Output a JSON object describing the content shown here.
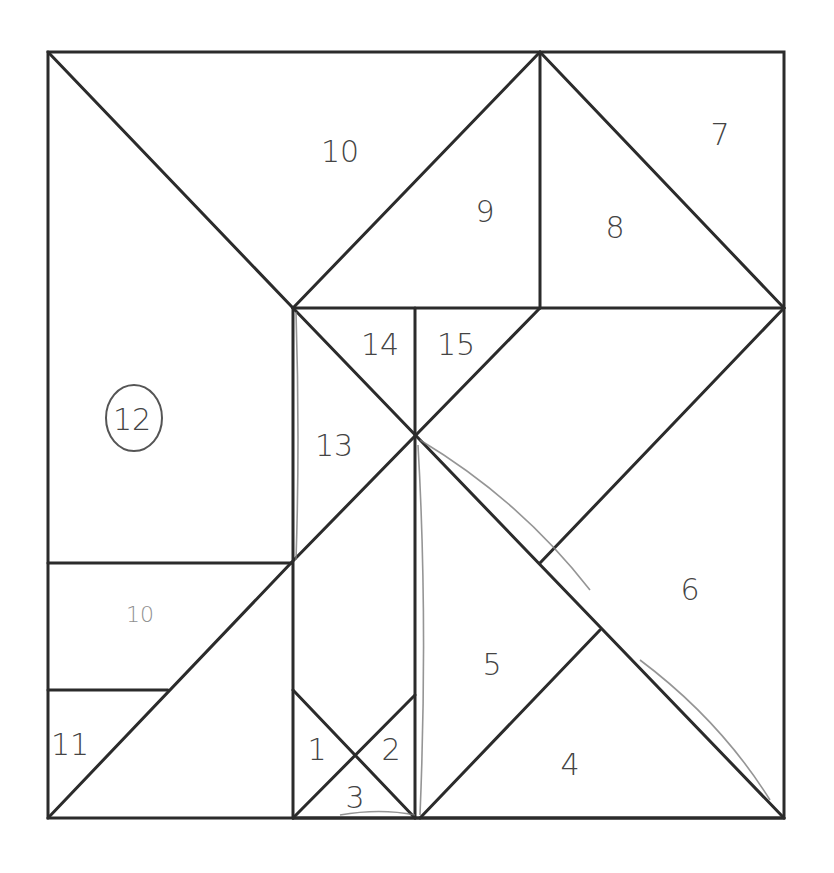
{
  "diagram": {
    "type": "dissection-puzzle",
    "outer_square": {
      "x1": 48,
      "y1": 52,
      "x2": 784,
      "y2": 818
    },
    "pieces": [
      {
        "id": 1,
        "label": "1",
        "x": 317,
        "y": 760
      },
      {
        "id": 2,
        "label": "2",
        "x": 391,
        "y": 760
      },
      {
        "id": 3,
        "label": "3",
        "x": 355,
        "y": 808
      },
      {
        "id": 4,
        "label": "4",
        "x": 570,
        "y": 775
      },
      {
        "id": 5,
        "label": "5",
        "x": 492,
        "y": 675
      },
      {
        "id": 6,
        "label": "6",
        "x": 690,
        "y": 600
      },
      {
        "id": 7,
        "label": "7",
        "x": 720,
        "y": 145
      },
      {
        "id": 8,
        "label": "8",
        "x": 615,
        "y": 238
      },
      {
        "id": 9,
        "label": "9",
        "x": 485,
        "y": 222
      },
      {
        "id": 10,
        "label": "10",
        "x": 340,
        "y": 162
      },
      {
        "id": 11,
        "label": "11",
        "x": 70,
        "y": 755
      },
      {
        "id": 12,
        "label": "12",
        "x": 132,
        "y": 430,
        "circled": true
      },
      {
        "id": 13,
        "label": "13",
        "x": 334,
        "y": 456
      },
      {
        "id": 14,
        "label": "14",
        "x": 380,
        "y": 355
      },
      {
        "id": 15,
        "label": "15",
        "x": 456,
        "y": 355
      },
      {
        "id": 16,
        "label": "10",
        "x": 140,
        "y": 622,
        "faint": true
      }
    ],
    "colors": {
      "line": "#2b2b2b",
      "pencil": "#7a7a7a",
      "label": "#444444",
      "background": "#ffffff"
    }
  }
}
